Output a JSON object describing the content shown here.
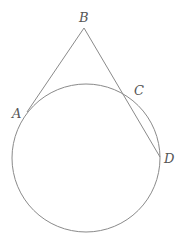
{
  "diagram": {
    "type": "geometry",
    "colors": {
      "stroke": "#8a8a8a",
      "label": "#555555",
      "background": "#ffffff"
    },
    "circle": {
      "cx": 86,
      "cy": 158,
      "r": 74
    },
    "points": [
      {
        "id": "A",
        "label": "A",
        "x": 27,
        "y": 112,
        "label_x": 12,
        "label_y": 118
      },
      {
        "id": "B",
        "label": "B",
        "x": 84,
        "y": 28,
        "label_x": 79,
        "label_y": 22
      },
      {
        "id": "C",
        "label": "C",
        "x": 130,
        "y": 98,
        "label_x": 134,
        "label_y": 95
      },
      {
        "id": "D",
        "label": "D",
        "x": 160,
        "y": 157,
        "label_x": 164,
        "label_y": 163
      }
    ],
    "segments": [
      {
        "from": "B",
        "to": "A",
        "kind": "tangent"
      },
      {
        "from": "B",
        "to": "D",
        "kind": "secant"
      }
    ]
  }
}
